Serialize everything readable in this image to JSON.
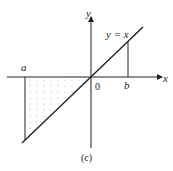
{
  "figure": {
    "caption": "(c)",
    "x_axis_label": "x",
    "y_axis_label": "y",
    "origin_label": "0",
    "line_label": "y = x",
    "point_a_label": "a",
    "point_b_label": "b",
    "shaded_region": "triangle between a and 0 below x-axis",
    "colors": {
      "stroke": "#222222",
      "shade_dots": "#999999"
    }
  }
}
